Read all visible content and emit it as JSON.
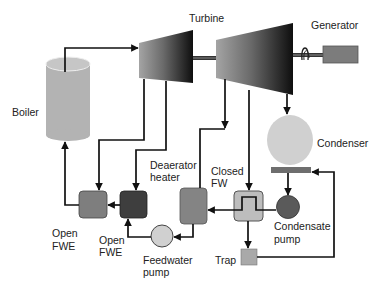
{
  "diagram": {
    "type": "rankine-cycle-schematic",
    "labels": {
      "turbine": "Turbine",
      "generator": "Generator",
      "boiler": "Boiler",
      "condenser": "Condenser",
      "deaerator_line1": "Deaerator",
      "deaerator_line2": "heater",
      "closed_fw_line1": "Closed",
      "closed_fw_line2": "FW",
      "open_fwe1_line1": "Open",
      "open_fwe1_line2": "FWE",
      "open_fwe2_line1": "Open",
      "open_fwe2_line2": "FWE",
      "feedwater_pump_line1": "Feedwater",
      "feedwater_pump_line2": "pump",
      "condensate_pump_line1": "Condensate",
      "condensate_pump_line2": "pump",
      "trap": "Trap"
    },
    "colors": {
      "line": "#111111",
      "boiler": "#b3b3b3",
      "boiler_top": "#c6c6c6",
      "turbine_light": "#a0a0a0",
      "turbine_dark": "#111111",
      "generator": "#7c7c7c",
      "condenser": "#d0d0d0",
      "condenser_plate": "#6e6e6e",
      "condensate_pump": "#5a5a5a",
      "feedwater_pump": "#d0d0d0",
      "open_fwe1": "#7e7e7e",
      "open_fwe2": "#3e3e3e",
      "deaerator": "#848484",
      "closed_fw": "#bdbdbd",
      "trap": "#a9a9a9"
    }
  }
}
